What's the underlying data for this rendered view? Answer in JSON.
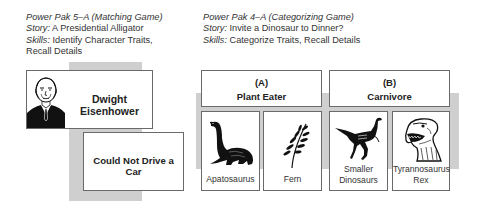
{
  "left_game": {
    "title": "Power Pak 5–A (Matching Game)",
    "story_label": "Story:",
    "story_value": "A Presidential Alligator",
    "skills_label": "Skills:",
    "skills_value_line1": "Identify Character Traits,",
    "skills_value_line2": "Recall Details",
    "cards": [
      {
        "label": "Dwight Eisenhower",
        "image": "eisenhower-portrait"
      },
      {
        "label": "Could Not Drive a Car"
      }
    ]
  },
  "right_game": {
    "title": "Power Pak 4–A (Categorizing Game)",
    "story_label": "Story:",
    "story_value": "Invite a Dinosaur to Dinner?",
    "skills_label": "Skills:",
    "skills_value": "Categorize Traits, Recall Details",
    "categories": [
      {
        "letter": "(A)",
        "name": "Plant Eater",
        "cards": [
          {
            "label_line1": "Apatosaurus",
            "label_line2": "",
            "image": "apatosaurus-illustration"
          },
          {
            "label_line1": "Fern",
            "label_line2": "",
            "image": "fern-illustration"
          }
        ]
      },
      {
        "letter": "(B)",
        "name": "Carnivore",
        "cards": [
          {
            "label_line1": "Smaller",
            "label_line2": "Dinosaurs",
            "image": "small-dinosaur-illustration"
          },
          {
            "label_line1": "Tyrannosaurus",
            "label_line2": "Rex",
            "image": "trex-illustration"
          }
        ]
      }
    ]
  },
  "colors": {
    "gray_band": "#cfcfcf",
    "card_border": "#6a6a6a",
    "text": "#222222"
  }
}
